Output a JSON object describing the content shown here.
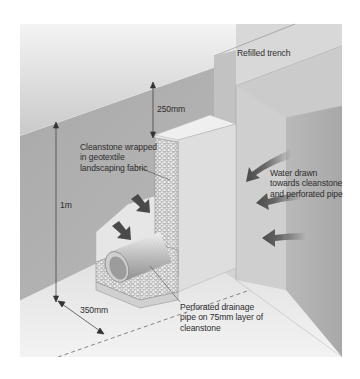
{
  "figure": {
    "type": "isometric cross-section illustration"
  },
  "labels": {
    "refilled_trench": "Refilled trench",
    "depth_top": "250mm",
    "depth_total": "1m",
    "width": "350mm",
    "cleanstone": "Cleanstone wrapped\nin geotextile\nlandscaping fabric",
    "water": "Water drawn\ntowards cleanstone\nand perforated pipe",
    "pipe": "Perforated drainage\npipe on 75mm layer of\ncleanstone"
  },
  "colors": {
    "background": "#ffffff",
    "wall_dark": "#9a9a9a",
    "wall_mid": "#b8b8b8",
    "surface_light": "#e2e2e2",
    "stone_fill": "#f2f2f2",
    "stone_outline": "#8a8a8a",
    "arrow": "#5a5a5a",
    "text": "#2e2e2e"
  },
  "arrows": [
    {
      "name": "water-arrow-1",
      "direction": "down-left",
      "side": "right"
    },
    {
      "name": "water-arrow-2",
      "direction": "left",
      "side": "right"
    },
    {
      "name": "water-arrow-3",
      "direction": "left",
      "side": "right"
    },
    {
      "name": "water-arrow-4",
      "direction": "down-right",
      "side": "left"
    },
    {
      "name": "water-arrow-5",
      "direction": "down-right",
      "side": "left"
    }
  ]
}
